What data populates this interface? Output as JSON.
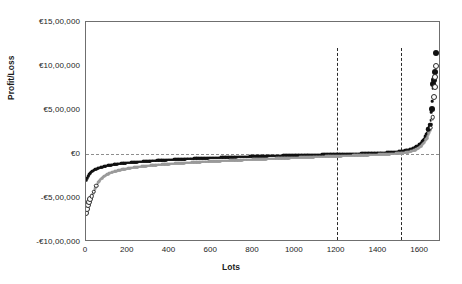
{
  "chart_data": {
    "type": "scatter",
    "title": "",
    "xlabel": "Lots",
    "ylabel": "Profit/Loss",
    "xlim": [
      0,
      1700
    ],
    "ylim": [
      -1000000,
      1500000
    ],
    "xticks": [
      0,
      200,
      400,
      600,
      800,
      1000,
      1200,
      1400,
      1600
    ],
    "xticklabels": [
      "0",
      "200",
      "400",
      "600",
      "800",
      "1000",
      "1200",
      "1400",
      "1600"
    ],
    "yticks": [
      -1000000,
      -500000,
      0,
      500000,
      1000000,
      1500000
    ],
    "yticklabels": [
      "-€10,00,000",
      "-€5,00,000",
      "€0",
      "€5,00,000",
      "€10,00,000",
      "€15,00,000"
    ],
    "grid": false,
    "legend": "none",
    "reference_lines": {
      "horizontal": [
        {
          "value": 0,
          "style": "dashed",
          "color": "#8e8e8e"
        }
      ],
      "vertical": [
        {
          "value": 1200,
          "style": "dashed",
          "color": "#2a2a2a"
        },
        {
          "value": 1510,
          "style": "dashed",
          "color": "#2a2a2a"
        }
      ]
    },
    "series": [
      {
        "name": "series-dark",
        "marker": "filled-circle",
        "color": "#111111",
        "points": [
          [
            2,
            -300000
          ],
          [
            6,
            -270000
          ],
          [
            12,
            -240000
          ],
          [
            20,
            -215000
          ],
          [
            30,
            -195000
          ],
          [
            45,
            -175000
          ],
          [
            60,
            -160000
          ],
          [
            80,
            -145000
          ],
          [
            100,
            -133000
          ],
          [
            125,
            -122000
          ],
          [
            150,
            -113000
          ],
          [
            180,
            -104000
          ],
          [
            220,
            -95000
          ],
          [
            260,
            -87000
          ],
          [
            300,
            -80000
          ],
          [
            350,
            -72000
          ],
          [
            400,
            -65000
          ],
          [
            460,
            -58000
          ],
          [
            520,
            -51000
          ],
          [
            580,
            -45000
          ],
          [
            650,
            -39000
          ],
          [
            720,
            -33000
          ],
          [
            800,
            -27000
          ],
          [
            880,
            -21000
          ],
          [
            960,
            -16000
          ],
          [
            1040,
            -11000
          ],
          [
            1120,
            -6000
          ],
          [
            1200,
            -2000
          ],
          [
            1280,
            3000
          ],
          [
            1360,
            9000
          ],
          [
            1430,
            16000
          ],
          [
            1480,
            24000
          ],
          [
            1520,
            36000
          ],
          [
            1560,
            58000
          ],
          [
            1590,
            95000
          ],
          [
            1610,
            140000
          ],
          [
            1625,
            200000
          ],
          [
            1638,
            280000
          ],
          [
            1648,
            330000
          ],
          [
            1655,
            510000
          ],
          [
            1662,
            800000
          ],
          [
            1666,
            840000
          ],
          [
            1670,
            930000
          ],
          [
            1675,
            1150000
          ]
        ]
      },
      {
        "name": "series-gray",
        "marker": "hollow-circle",
        "color": "#9a9a9a",
        "points": [
          [
            2,
            -670000
          ],
          [
            5,
            -620000
          ],
          [
            9,
            -580000
          ],
          [
            14,
            -545000
          ],
          [
            20,
            -510000
          ],
          [
            28,
            -480000
          ],
          [
            38,
            -430000
          ],
          [
            50,
            -360000
          ],
          [
            65,
            -300000
          ],
          [
            85,
            -255000
          ],
          [
            110,
            -220000
          ],
          [
            140,
            -195000
          ],
          [
            175,
            -175000
          ],
          [
            215,
            -158000
          ],
          [
            260,
            -143000
          ],
          [
            310,
            -130000
          ],
          [
            370,
            -118000
          ],
          [
            430,
            -107000
          ],
          [
            500,
            -97000
          ],
          [
            570,
            -87000
          ],
          [
            650,
            -78000
          ],
          [
            730,
            -69000
          ],
          [
            820,
            -60000
          ],
          [
            900,
            -52000
          ],
          [
            980,
            -44000
          ],
          [
            1060,
            -36000
          ],
          [
            1140,
            -29000
          ],
          [
            1220,
            -22000
          ],
          [
            1300,
            -15000
          ],
          [
            1380,
            -8000
          ],
          [
            1450,
            0
          ],
          [
            1500,
            8000
          ],
          [
            1540,
            20000
          ],
          [
            1575,
            45000
          ],
          [
            1600,
            80000
          ],
          [
            1620,
            130000
          ],
          [
            1635,
            190000
          ],
          [
            1645,
            250000
          ],
          [
            1652,
            300000
          ],
          [
            1660,
            420000
          ],
          [
            1665,
            650000
          ],
          [
            1669,
            760000
          ],
          [
            1672,
            870000
          ],
          [
            1676,
            1000000
          ]
        ]
      }
    ]
  }
}
